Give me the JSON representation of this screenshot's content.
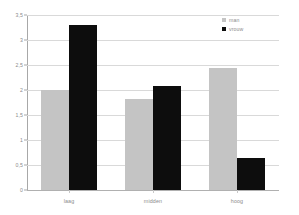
{
  "chart_data": {
    "type": "bar",
    "title": "",
    "subtitle": "",
    "xlabel": "",
    "ylabel": "",
    "categories": [
      "laag",
      "midden",
      "hoog"
    ],
    "series": [
      {
        "name": "man",
        "color": "#c4c4c4",
        "values": [
          2.0,
          1.82,
          2.45
        ]
      },
      {
        "name": "vrouw",
        "color": "#0d0d0d",
        "values": [
          3.3,
          2.08,
          0.64
        ]
      }
    ],
    "ylim": [
      0,
      3.5
    ],
    "yticks": [
      0,
      0.5,
      1,
      1.5,
      2,
      2.5,
      3,
      3.5
    ],
    "ytick_labels": [
      "0",
      "0,5",
      "1",
      "1,5",
      "2",
      "2,5",
      "3",
      "3,5"
    ],
    "grid": true,
    "grid_axis": "y",
    "legend_position": "top-right",
    "annotations": []
  },
  "legend": {
    "items": [
      {
        "label": "man"
      },
      {
        "label": "vrouw"
      }
    ]
  },
  "colors": {
    "background": "#ffffff",
    "gridline": "#d9d9d9",
    "axis": "#a8a8a8",
    "tick_text": "#8c8c8c",
    "series_man": "#c4c4c4",
    "series_vrouw": "#0d0d0d"
  }
}
